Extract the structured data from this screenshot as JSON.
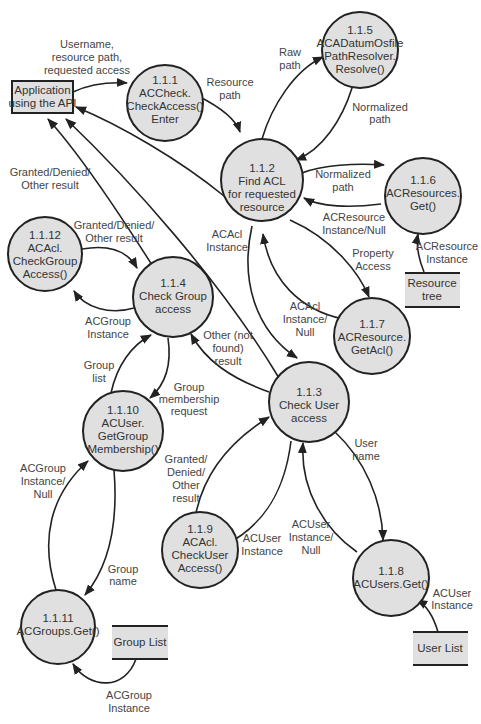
{
  "diagram": {
    "type": "data-flow-diagram",
    "external_entities": [
      {
        "id": "app",
        "lines": [
          "Application",
          "using the API"
        ]
      }
    ],
    "processes": [
      {
        "id": "p111",
        "lines": [
          "1.1.1",
          "ACCheck.",
          "CheckAccess()",
          "Enter"
        ]
      },
      {
        "id": "p112",
        "lines": [
          "1.1.2",
          "Find ACL",
          "for requested",
          "resource"
        ]
      },
      {
        "id": "p113",
        "lines": [
          "1.1.3",
          "Check User",
          "access"
        ]
      },
      {
        "id": "p114",
        "lines": [
          "1.1.4",
          "Check Group",
          "access"
        ]
      },
      {
        "id": "p115",
        "lines": [
          "1.1.5",
          "ACADatumOsfile",
          "PathResolver.",
          "Resolve()"
        ]
      },
      {
        "id": "p116",
        "lines": [
          "1.1.6",
          "ACResources.",
          "Get()"
        ]
      },
      {
        "id": "p117",
        "lines": [
          "1.1.7",
          "ACResource.",
          "GetAcl()"
        ]
      },
      {
        "id": "p118",
        "lines": [
          "1.1.8",
          "ACUsers.Get()"
        ]
      },
      {
        "id": "p119",
        "lines": [
          "1.1.9",
          "ACAcl.",
          "CheckUser",
          "Access()"
        ]
      },
      {
        "id": "p1110",
        "lines": [
          "1.1.10",
          "ACUser.",
          "GetGroup",
          "Membership()"
        ]
      },
      {
        "id": "p1111",
        "lines": [
          "1.1.11",
          "ACGroups.Get()"
        ]
      },
      {
        "id": "p1112",
        "lines": [
          "1.1.12",
          "ACAcl.",
          "CheckGroup",
          "Access()"
        ]
      }
    ],
    "data_stores": [
      {
        "id": "resource_tree",
        "lines": [
          "Resource",
          "tree"
        ]
      },
      {
        "id": "group_list",
        "lines": [
          "Group List"
        ]
      },
      {
        "id": "user_list",
        "lines": [
          "User List"
        ]
      }
    ],
    "flows": [
      {
        "id": "f1",
        "from": "app",
        "to": "p111",
        "lines": [
          "Username,",
          "resource path,",
          "requested access"
        ]
      },
      {
        "id": "f2",
        "from": "p111",
        "to": "p112",
        "lines": [
          "Resource",
          "path"
        ]
      },
      {
        "id": "f3",
        "from": "p112",
        "to": "p115",
        "lines": [
          "Raw",
          "path"
        ]
      },
      {
        "id": "f4",
        "from": "p115",
        "to": "p112",
        "lines": [
          "Normalized",
          "path"
        ]
      },
      {
        "id": "f5",
        "from": "p112",
        "to": "p116",
        "lines": [
          "Normalized",
          "path"
        ]
      },
      {
        "id": "f6",
        "from": "p116",
        "to": "p112",
        "lines": [
          "ACResource",
          "Instance/Null"
        ]
      },
      {
        "id": "f7",
        "from": "resource_tree",
        "to": "p116",
        "lines": [
          "ACResource",
          "Instance"
        ]
      },
      {
        "id": "f8",
        "from": "p112",
        "to": "p117",
        "lines": [
          "Property",
          "Access"
        ]
      },
      {
        "id": "f9",
        "from": "p117",
        "to": "p112",
        "lines": [
          "ACAcl",
          "Instance/",
          "Null"
        ]
      },
      {
        "id": "f10",
        "from": "p112",
        "to": "p113",
        "lines": [
          "ACAcl",
          "Instance"
        ]
      },
      {
        "id": "f11",
        "from": "p112",
        "to": "app",
        "lines": []
      },
      {
        "id": "f12",
        "from": "p114",
        "to": "app",
        "lines": [
          "Granted/Denied/",
          "Other result"
        ]
      },
      {
        "id": "f13",
        "from": "p113",
        "to": "app",
        "lines": []
      },
      {
        "id": "f14",
        "from": "p1112",
        "to": "p114",
        "lines": [
          "Granted/Denied/",
          "Other result"
        ]
      },
      {
        "id": "f15",
        "from": "p114",
        "to": "p1112",
        "lines": [
          "ACGroup",
          "Instance"
        ]
      },
      {
        "id": "f16",
        "from": "p113",
        "to": "p114",
        "lines": [
          "Other (not",
          "found)",
          "result"
        ]
      },
      {
        "id": "f17",
        "from": "p1110",
        "to": "p114",
        "lines": [
          "Group",
          "list"
        ]
      },
      {
        "id": "f18",
        "from": "p114",
        "to": "p1110",
        "lines": [
          "Group",
          "membership",
          "request"
        ]
      },
      {
        "id": "f19",
        "from": "p1111",
        "to": "p1110",
        "lines": [
          "ACGroup",
          "Instance/",
          "Null"
        ]
      },
      {
        "id": "f20",
        "from": "p1110",
        "to": "p1111",
        "lines": [
          "Group",
          "name"
        ]
      },
      {
        "id": "f21",
        "from": "group_list",
        "to": "p1111",
        "lines": [
          "ACGroup",
          "Instance"
        ]
      },
      {
        "id": "f22",
        "from": "p119",
        "to": "p113",
        "lines": [
          "Granted/",
          "Denied/",
          "Other",
          "result"
        ]
      },
      {
        "id": "f23",
        "from": "p113",
        "to": "p119",
        "lines": [
          "ACUser",
          "Instance"
        ]
      },
      {
        "id": "f24",
        "from": "p113",
        "to": "p118",
        "lines": [
          "User",
          "name"
        ]
      },
      {
        "id": "f25",
        "from": "p118",
        "to": "p113",
        "lines": [
          "ACUser",
          "Instance/",
          "Null"
        ]
      },
      {
        "id": "f26",
        "from": "user_list",
        "to": "p118",
        "lines": [
          "ACUser",
          "Instance"
        ]
      }
    ]
  },
  "colors": {
    "node_fill": "#e0e0e0",
    "stroke": "#222222",
    "text": "#333333",
    "background": "#ffffff"
  }
}
